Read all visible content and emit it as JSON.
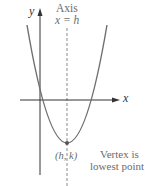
{
  "diagram": {
    "axis_label_line1": "Axis",
    "axis_label_line2": "x = h",
    "y_axis_label": "y",
    "x_axis_label": "x",
    "vertex_label": "(h, k)",
    "vertex_note_line1": "Vertex is",
    "vertex_note_line2": "lowest point",
    "colors": {
      "curve": "#6e6e6e",
      "axes": "#333333",
      "axis_of_symmetry": "#8a8a8a",
      "text": "#6b6b6b",
      "vertex_dot": "#555555"
    },
    "geometry": {
      "x_axis_y": 100,
      "y_axis_x": 40,
      "axis_of_symmetry_x": 67,
      "vertex": [
        67,
        143
      ],
      "curve_left_top": [
        27,
        25
      ],
      "curve_right_top": [
        106,
        25
      ]
    }
  }
}
